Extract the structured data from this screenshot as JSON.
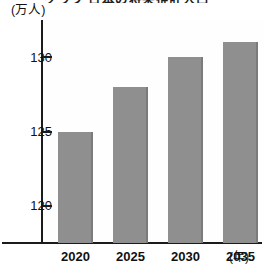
{
  "chart_data": {
    "type": "bar",
    "title": "グラフ 日本の将来推計人口",
    "categories": [
      "2020",
      "2025",
      "2030",
      "2035"
    ],
    "values": [
      125.0,
      128.0,
      130.0,
      131.0
    ],
    "xlabel": "(年)",
    "ylabel": "(万人)",
    "ylim": [
      117.5,
      132.5
    ],
    "yticks": [
      120,
      125,
      130
    ],
    "ytick_labels": [
      "120",
      "125",
      "130"
    ],
    "grid": false,
    "legend": "none",
    "bar_color": "#8f8f8f",
    "axis_color": "#1b1b1b",
    "background": "#ffffff"
  },
  "axes": {
    "y_unit": "(万人)",
    "x_unit": "(年)"
  }
}
